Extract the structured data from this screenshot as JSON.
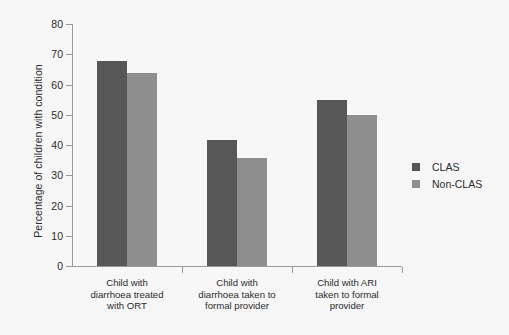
{
  "chart_data": {
    "type": "bar",
    "title": "",
    "xlabel": "",
    "ylabel": "Percentage of children with condition",
    "ylim": [
      0,
      80
    ],
    "yticks": [
      0,
      10,
      20,
      30,
      40,
      50,
      60,
      70,
      80
    ],
    "grid": false,
    "legend_position": "right",
    "categories": [
      "Child with diarrhoea treated with ORT",
      "Child with diarrhoea taken to formal provider",
      "Child with ARI taken to formal provider"
    ],
    "category_lines": [
      [
        "Child with",
        "diarrhoea treated",
        "with ORT"
      ],
      [
        "Child with",
        "diarrhoea taken to",
        "formal provider"
      ],
      [
        "Child with ARI",
        "taken to formal",
        "provider"
      ]
    ],
    "series": [
      {
        "name": "CLAS",
        "color": "#575757",
        "values": [
          67.8,
          41.8,
          54.8
        ]
      },
      {
        "name": "Non-CLAS",
        "color": "#8e8e8e",
        "values": [
          63.8,
          35.6,
          50.0
        ]
      }
    ]
  },
  "colors": {
    "background": "#f7f7f7",
    "axis": "#9a9a9a",
    "text": "#2b2b2b",
    "series_clas": "#575757",
    "series_non_clas": "#8e8e8e"
  }
}
